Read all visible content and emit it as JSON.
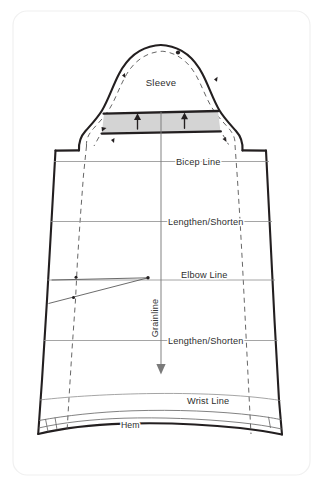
{
  "figure": {
    "kind": "sewing-pattern-diagram",
    "background_color": "#ffffff",
    "card_border_color": "#f0f0f0",
    "ink_color": "#231f20",
    "band_fill_color": "#d4d4d4"
  },
  "labels": {
    "sleeve": "Sleeve",
    "bicep_line": "Bicep  Line",
    "lengthen_shorten_upper": "Lengthen/Shorten",
    "elbow_line": "Elbow Line",
    "grainline": "Grainline",
    "lengthen_shorten_lower": "Lengthen/Shorten",
    "wrist_line": "Wrist Line",
    "hem": "Hem"
  },
  "markings": {
    "cap_ease_arrow_left": "up-arrow",
    "cap_ease_arrow_right": "up-arrow",
    "grainline_arrow": "down-arrow",
    "cap_center_notch": "dot-notch",
    "front_notch": "single-notch",
    "back_notch": "double-notch"
  }
}
